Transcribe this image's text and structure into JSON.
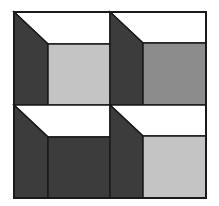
{
  "figure": {
    "type": "2x2 grid of open-box / cube illusion cells",
    "rows": 2,
    "cols": 2,
    "colors": {
      "background": "#ffffff",
      "outline": "#1a1a1a",
      "top_face": "#ffffff",
      "left_face": "#3c3c3c",
      "light_gray": "#c4c4c4",
      "medium_gray": "#8c8c8c",
      "dark_gray": "#3c3c3c"
    },
    "cells": [
      {
        "position": "top-left",
        "back_face_color": "#c4c4c4"
      },
      {
        "position": "top-right",
        "back_face_color": "#8c8c8c"
      },
      {
        "position": "bottom-left",
        "back_face_color": "#3c3c3c"
      },
      {
        "position": "bottom-right",
        "back_face_color": "#c4c4c4"
      }
    ]
  }
}
